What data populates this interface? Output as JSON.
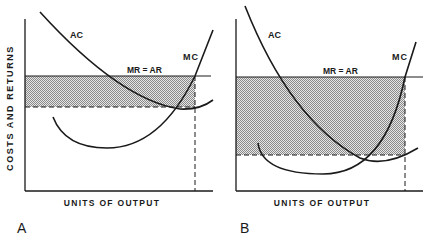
{
  "figure": {
    "y_axis_label": "COSTS AND RETURNS",
    "colors": {
      "ink": "#1a1a1a",
      "shade": "#bdbdbd",
      "background": "#ffffff"
    },
    "panels": [
      {
        "id": "A",
        "letter": "A",
        "x_axis_label": "UNITS OF OUTPUT",
        "curve_labels": {
          "ac": "AC",
          "mc": "MC",
          "mr_ar": "MR = AR"
        },
        "shaded_region": "profit area between MR = AR and minimum AC (narrow)"
      },
      {
        "id": "B",
        "letter": "B",
        "x_axis_label": "UNITS OF OUTPUT",
        "curve_labels": {
          "ac": "AC",
          "mc": "MC",
          "mr_ar": "MR = AR"
        },
        "shaded_region": "profit area between MR = AR and minimum AC (wide)"
      }
    ]
  }
}
